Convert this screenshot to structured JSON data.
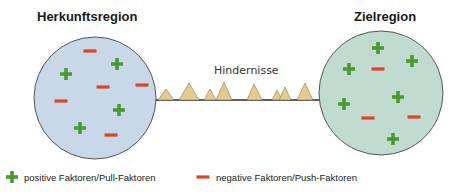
{
  "diagram": {
    "origin": {
      "title": "Herkunftsregion",
      "fill": "#c9d8e8",
      "plus_count": 4,
      "minus_count": 5
    },
    "destination": {
      "title": "Zielregion",
      "fill": "#c0dcd0",
      "plus_count": 7,
      "minus_count": 3
    },
    "obstacles": {
      "label": "Hindernisse",
      "fill": "#e3cb8c",
      "count": 9
    },
    "colors": {
      "positive": "#4a9a2e",
      "negative": "#e0441f",
      "outline": "#555555"
    }
  },
  "legend": {
    "positive": "positive Faktoren/Pull-Faktoren",
    "negative": "negative Faktoren/Push-Faktoren"
  }
}
